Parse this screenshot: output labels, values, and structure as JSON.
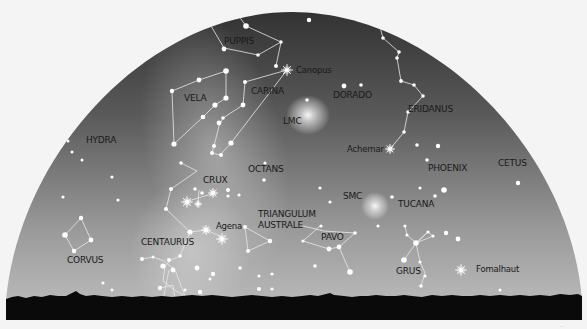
{
  "chart": {
    "title_visible": false,
    "sky": {
      "top_color": "#3a3a3a",
      "bottom_color": "#b8b8b8",
      "background": "#f4f4f4",
      "horizon_color": "#0a0a0a"
    },
    "constellations": [
      {
        "name": "PUPPIS",
        "x": 224,
        "y": 42
      },
      {
        "name": "VELA",
        "x": 184,
        "y": 100
      },
      {
        "name": "CARINA",
        "x": 251,
        "y": 94
      },
      {
        "name": "DORADO",
        "x": 333,
        "y": 98
      },
      {
        "name": "ERIDANUS",
        "x": 408,
        "y": 112
      },
      {
        "name": "HYDRA",
        "x": 86,
        "y": 143
      },
      {
        "name": "OCTANS",
        "x": 248,
        "y": 172
      },
      {
        "name": "CRUX",
        "x": 203,
        "y": 182
      },
      {
        "name": "PHOENIX",
        "x": 428,
        "y": 171
      },
      {
        "name": "CETUS",
        "x": 498,
        "y": 166
      },
      {
        "name": "TUCANA",
        "x": 398,
        "y": 207
      },
      {
        "name": "TRIANGULUM",
        "x": 258,
        "y": 217
      },
      {
        "name": "AUSTRALE",
        "x": 258,
        "y": 228
      },
      {
        "name": "PAVO",
        "x": 321,
        "y": 240
      },
      {
        "name": "CENTAURUS",
        "x": 141,
        "y": 245
      },
      {
        "name": "CORVUS",
        "x": 67,
        "y": 262
      },
      {
        "name": "GRUS",
        "x": 396,
        "y": 273
      }
    ],
    "named_stars": [
      {
        "name": "Canopus",
        "x": 296,
        "y": 72
      },
      {
        "name": "Achernar",
        "x": 347,
        "y": 151
      },
      {
        "name": "Agena",
        "x": 216,
        "y": 229
      },
      {
        "name": "Fomalhaut",
        "x": 476,
        "y": 271
      }
    ],
    "deep_sky": [
      {
        "name": "LMC",
        "x": 283,
        "y": 124
      },
      {
        "name": "SMC",
        "x": 343,
        "y": 199
      }
    ],
    "credit": "..."
  }
}
